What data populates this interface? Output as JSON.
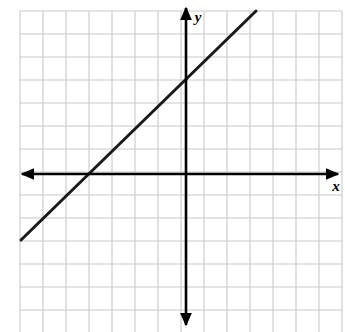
{
  "figure": {
    "kind": "coordinate-plane-line-graph",
    "width": 345,
    "height": 332,
    "background_color": "#ffffff"
  },
  "grid": {
    "visible": true,
    "line_color": "#c9c9c9",
    "line_width": 1.1,
    "cell_size_px": 23,
    "origin_px": [
      20,
      11
    ],
    "columns": 14,
    "rows": 14,
    "left_px": 20,
    "top_px": 11,
    "right_px": 342,
    "bottom_px": 333
  },
  "axes": {
    "color": "#000000",
    "line_width": 2.6,
    "arrowheads": "both-ends",
    "origin_px": [
      186,
      174
    ],
    "x_axis": {
      "label": "x",
      "label_pos_px": [
        336,
        191
      ],
      "start_px": [
        22,
        174
      ],
      "end_px": [
        338,
        174
      ],
      "units_left_of_origin": 7.2,
      "units_right_of_origin": 6.8
    },
    "y_axis": {
      "label": "y",
      "label_pos_px": [
        198,
        22
      ],
      "start_px": [
        186,
        325
      ],
      "end_px": [
        186,
        8
      ],
      "units_above_origin": 7.1,
      "units_below_origin": 6.6
    }
  },
  "chart_data": {
    "type": "line",
    "title": "",
    "xlabel": "x",
    "ylabel": "y",
    "grid": true,
    "legend": "none",
    "xlim": [
      -7.2,
      6.8
    ],
    "ylim": [
      -6.6,
      7.1
    ],
    "x_tick_step": 1,
    "y_tick_step": 1,
    "tick_labels_shown": false,
    "series": [
      {
        "name": "y = x + 4",
        "equation": "y = x + 4",
        "slope": 1,
        "y_intercept": 4,
        "x_intercept": -4,
        "color": "#1a1a1a",
        "line_width": 3,
        "x": [
          -7.2,
          3.1
        ],
        "values": [
          -3.2,
          7.1
        ],
        "endpoints_px": [
          [
            21,
            240
          ],
          [
            256,
            11
          ]
        ],
        "points": [
          {
            "x": -4,
            "y": 0,
            "px": [
              94,
              174
            ]
          },
          {
            "x": 0,
            "y": 4,
            "px": [
              186,
              82
            ]
          }
        ]
      }
    ]
  }
}
